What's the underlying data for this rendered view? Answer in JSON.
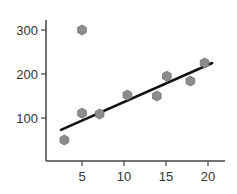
{
  "chart_data": {
    "type": "scatter",
    "title": "",
    "xlabel": "",
    "ylabel": "",
    "xlim": [
      0,
      22
    ],
    "ylim": [
      0,
      320
    ],
    "grid": false,
    "x_ticks": [
      5,
      10,
      15,
      20
    ],
    "y_ticks": [
      100,
      200,
      300
    ],
    "series": [
      {
        "name": "points",
        "marker": "hexagon",
        "color": "#8c8c8c",
        "points": [
          {
            "x": 2.9,
            "y": 50
          },
          {
            "x": 5.0,
            "y": 300
          },
          {
            "x": 5.0,
            "y": 111
          },
          {
            "x": 7.1,
            "y": 109
          },
          {
            "x": 10.4,
            "y": 152
          },
          {
            "x": 13.9,
            "y": 150
          },
          {
            "x": 15.1,
            "y": 195
          },
          {
            "x": 17.9,
            "y": 184
          },
          {
            "x": 19.6,
            "y": 225
          }
        ]
      }
    ],
    "trendline": {
      "color": "#111111",
      "start": {
        "x": 2.5,
        "y": 73
      },
      "end": {
        "x": 20.5,
        "y": 225
      }
    }
  },
  "axes": {
    "color": "#444444"
  }
}
